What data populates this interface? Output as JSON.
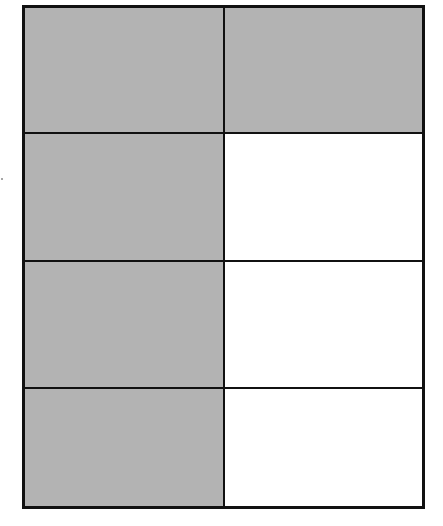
{
  "diagram": {
    "type": "fraction-area-model",
    "rows": 4,
    "columns": 2,
    "total_parts": 8,
    "shaded_parts": 5,
    "colors": {
      "shaded": "#b3b3b3",
      "unshaded": "#ffffff",
      "border": "#111111"
    },
    "cells": [
      {
        "row": 1,
        "col": 1,
        "shaded": true
      },
      {
        "row": 1,
        "col": 2,
        "shaded": true
      },
      {
        "row": 2,
        "col": 1,
        "shaded": true
      },
      {
        "row": 2,
        "col": 2,
        "shaded": false
      },
      {
        "row": 3,
        "col": 1,
        "shaded": true
      },
      {
        "row": 3,
        "col": 2,
        "shaded": false
      },
      {
        "row": 4,
        "col": 1,
        "shaded": true
      },
      {
        "row": 4,
        "col": 2,
        "shaded": false
      }
    ]
  }
}
